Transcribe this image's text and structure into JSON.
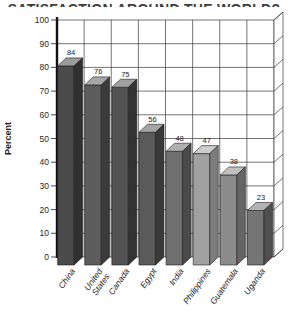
{
  "figure": {
    "cropped_title_text": "SATISFACTION AROUND THE WORLD?"
  },
  "chart_data": {
    "type": "bar",
    "style": "3d-vertical-bars",
    "ylabel": "Percent",
    "xlabel": "",
    "ylim": [
      0,
      100
    ],
    "ytick_step": 10,
    "yticks": [
      0,
      10,
      20,
      30,
      40,
      50,
      60,
      70,
      80,
      90,
      100
    ],
    "grid": true,
    "legend": false,
    "categories": [
      "China",
      "United States",
      "Canada",
      "Egypt",
      "India",
      "Philippines",
      "Guatemala",
      "Uganda"
    ],
    "values": [
      84,
      76,
      75,
      56,
      48,
      47,
      38,
      23
    ],
    "label_lines": [
      [
        "China"
      ],
      [
        "United",
        "States"
      ],
      [
        "Canada"
      ],
      [
        "Egypt"
      ],
      [
        "India"
      ],
      [
        "Philippines"
      ],
      [
        "Guatemala"
      ],
      [
        "Uganda"
      ]
    ],
    "bar_styles": [
      {
        "front": "#4b4b4b",
        "top": "#9b9b9b",
        "side": "#2f2f2f"
      },
      {
        "front": "#5d5d5d",
        "top": "#a7a7a7",
        "side": "#3b3b3b"
      },
      {
        "front": "#525252",
        "top": "#9f9f9f",
        "side": "#333333"
      },
      {
        "front": "#5a5a5a",
        "top": "#a5a5a5",
        "side": "#393939"
      },
      {
        "front": "#6f6f6f",
        "top": "#b0b0b0",
        "side": "#4a4a4a"
      },
      {
        "front": "#a1a1a1",
        "top": "#cccccc",
        "side": "#7d7d7d"
      },
      {
        "front": "#8c8c8c",
        "top": "#c0c0c0",
        "side": "#656565"
      },
      {
        "front": "#757575",
        "top": "#b3b3b3",
        "side": "#4f4f4f"
      }
    ],
    "colors": {
      "grid": "#3a3a3a",
      "axis": "#111111",
      "text": "#1f1f1f",
      "wall_fill": "#ffffff",
      "background": "#ffffff"
    }
  }
}
